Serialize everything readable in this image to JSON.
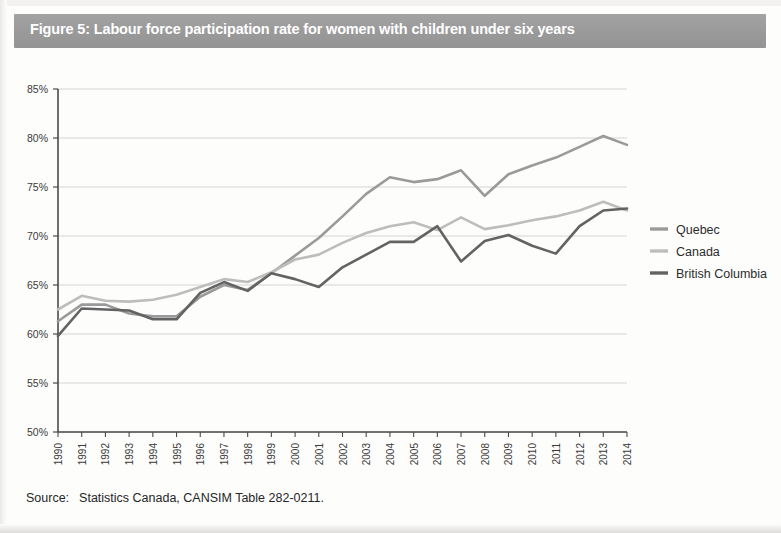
{
  "figure": {
    "title": "Figure 5: Labour force participation rate for women with children under six years",
    "title_bar_color": "#9b9b9b",
    "source_label": "Source:",
    "source_text": "Statistics Canada, CANSIM Table 282-0211."
  },
  "legend": {
    "position": "right",
    "items": [
      {
        "label": "Quebec",
        "color": "#9a9a9a"
      },
      {
        "label": "Canada",
        "color": "#bdbdbd"
      },
      {
        "label": "British Columbia",
        "color": "#636363"
      }
    ]
  },
  "chart_data": {
    "type": "line",
    "title": "Figure 5: Labour force participation rate for women with children under six years",
    "xlabel": "",
    "ylabel": "",
    "grid": true,
    "legend_position": "right",
    "ylim": [
      50,
      85
    ],
    "ytick_labels": [
      "85%",
      "80%",
      "75%",
      "70%",
      "65%",
      "60%",
      "55%",
      "50%"
    ],
    "ytick_values": [
      85,
      80,
      75,
      70,
      65,
      60,
      55,
      50
    ],
    "x": [
      1990,
      1991,
      1992,
      1993,
      1994,
      1995,
      1996,
      1997,
      1998,
      1999,
      2000,
      2001,
      2002,
      2003,
      2004,
      2005,
      2006,
      2007,
      2008,
      2009,
      2010,
      2011,
      2012,
      2013,
      2014
    ],
    "xtick_labels": [
      "1990",
      "1991",
      "1992",
      "1993",
      "1994",
      "1995",
      "1996",
      "1997",
      "1998",
      "1999",
      "2000",
      "2001",
      "2002",
      "2003",
      "2004",
      "2005",
      "2006",
      "2007",
      "2008",
      "2009",
      "2010",
      "2011",
      "2012",
      "2013",
      "2014"
    ],
    "series": [
      {
        "name": "Quebec",
        "color": "#9a9a9a",
        "values": [
          61.3,
          63.0,
          63.0,
          62.1,
          61.8,
          61.8,
          63.8,
          65.0,
          64.5,
          66.2,
          68.0,
          69.8,
          72.0,
          74.3,
          76.0,
          75.5,
          75.8,
          76.7,
          74.1,
          76.3,
          77.2,
          78.0,
          79.1,
          80.2,
          79.3
        ]
      },
      {
        "name": "Canada",
        "color": "#bdbdbd",
        "values": [
          62.5,
          63.9,
          63.4,
          63.3,
          63.5,
          64.0,
          64.8,
          65.6,
          65.3,
          66.3,
          67.6,
          68.1,
          69.3,
          70.3,
          71.0,
          71.4,
          70.6,
          71.9,
          70.7,
          71.1,
          71.6,
          72.0,
          72.6,
          73.5,
          72.6
        ]
      },
      {
        "name": "British Columbia",
        "color": "#636363",
        "values": [
          59.8,
          62.6,
          62.5,
          62.4,
          61.5,
          61.5,
          64.2,
          65.3,
          64.4,
          66.2,
          65.6,
          64.8,
          66.8,
          68.1,
          69.4,
          69.4,
          71.0,
          67.4,
          69.5,
          70.1,
          69.0,
          68.2,
          71.0,
          72.6,
          72.8
        ]
      }
    ]
  }
}
